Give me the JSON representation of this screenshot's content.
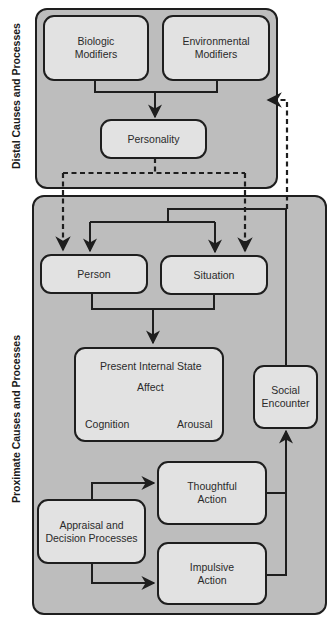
{
  "diagram": {
    "sections": {
      "distal": {
        "label": "Distal Causes and Processes"
      },
      "proximate": {
        "label": "Proximate Causes and Processes"
      }
    },
    "nodes": {
      "biologic": "Biologic\nModifiers",
      "environmental": "Environmental\nModifiers",
      "personality": "Personality",
      "person": "Person",
      "situation": "Situation",
      "present_state": {
        "title": "Present Internal State",
        "affect": "Affect",
        "cognition": "Cognition",
        "arousal": "Arousal"
      },
      "social_encounter": "Social\nEncounter",
      "appraisal": "Appraisal and\nDecision Processes",
      "thoughtful": "Thoughtful\nAction",
      "impulsive": "Impulsive\nAction"
    },
    "edges": [
      {
        "from": "Biologic Modifiers",
        "to": "Personality",
        "style": "solid"
      },
      {
        "from": "Environmental Modifiers",
        "to": "Personality",
        "style": "solid"
      },
      {
        "from": "Personality",
        "to": "Person",
        "style": "dashed"
      },
      {
        "from": "Personality",
        "to": "Situation",
        "style": "dashed"
      },
      {
        "from": "Person",
        "to": "Present Internal State",
        "style": "solid"
      },
      {
        "from": "Situation",
        "to": "Present Internal State",
        "style": "solid"
      },
      {
        "from": "Appraisal and Decision Processes",
        "to": "Thoughtful Action",
        "style": "solid"
      },
      {
        "from": "Appraisal and Decision Processes",
        "to": "Impulsive Action",
        "style": "solid"
      },
      {
        "from": "Thoughtful Action",
        "to": "Social Encounter",
        "style": "solid"
      },
      {
        "from": "Impulsive Action",
        "to": "Social Encounter",
        "style": "solid"
      },
      {
        "from": "Social Encounter",
        "to": "Person",
        "style": "solid"
      },
      {
        "from": "Social Encounter",
        "to": "Situation",
        "style": "solid"
      },
      {
        "from": "Social Encounter",
        "to": "Distal Causes and Processes",
        "style": "dashed"
      }
    ],
    "colors": {
      "panel": "#bdbdbd",
      "node": "#e2e2e2",
      "stroke": "#1e1e1e"
    }
  }
}
